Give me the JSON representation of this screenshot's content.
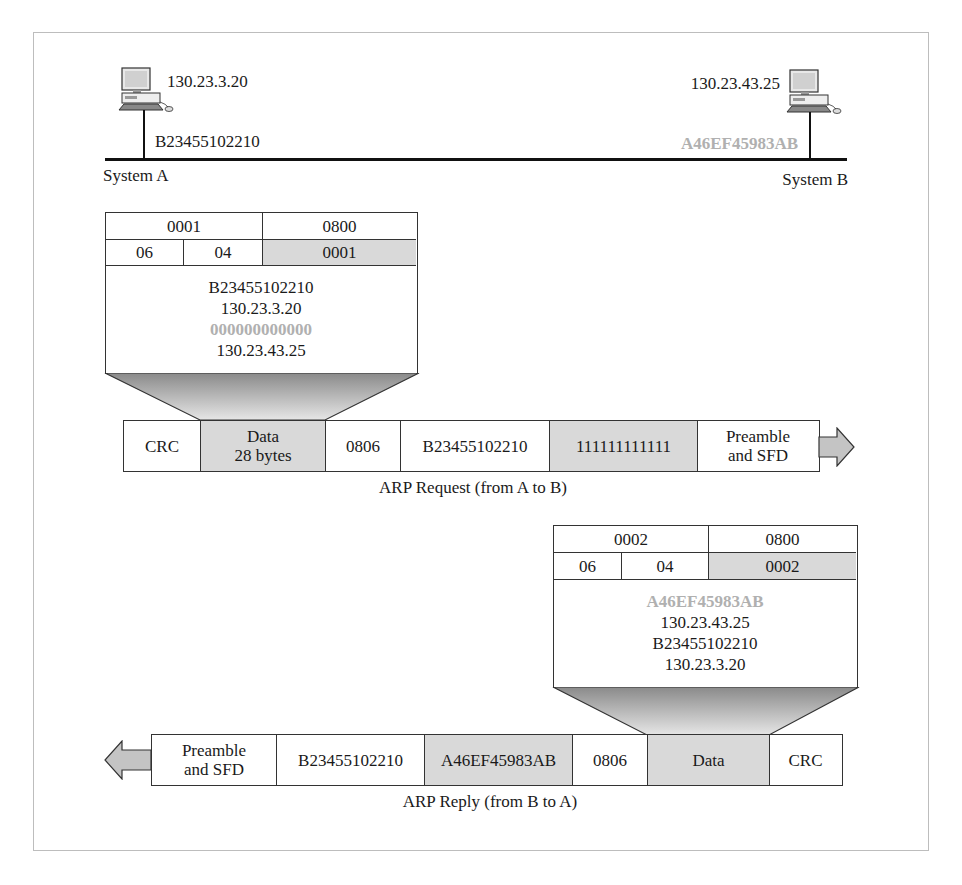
{
  "network": {
    "system_a": {
      "label": "System A",
      "ip": "130.23.3.20",
      "mac": "B23455102210"
    },
    "system_b": {
      "label": "System B",
      "ip": "130.23.43.25",
      "mac": "A46EF45983AB"
    }
  },
  "request": {
    "packet": {
      "hardware_type": "0001",
      "protocol_type": "0800",
      "hardware_length": "06",
      "protocol_length": "04",
      "operation": "0001",
      "sender_mac": "B23455102210",
      "sender_ip": "130.23.3.20",
      "target_mac": "000000000000",
      "target_ip": "130.23.43.25"
    },
    "frame": {
      "crc": "CRC",
      "data_line1": "Data",
      "data_line2": "28 bytes",
      "type": "0806",
      "source": "B23455102210",
      "destination": "111111111111",
      "preamble_line1": "Preamble",
      "preamble_line2": "and SFD"
    },
    "caption": "ARP Request (from A to B)"
  },
  "reply": {
    "packet": {
      "hardware_type": "0002",
      "protocol_type": "0800",
      "hardware_length": "06",
      "protocol_length": "04",
      "operation": "0002",
      "sender_mac": "A46EF45983AB",
      "sender_ip": "130.23.43.25",
      "target_mac": "B23455102210",
      "target_ip": "130.23.3.20"
    },
    "frame": {
      "preamble_line1": "Preamble",
      "preamble_line2": "and SFD",
      "destination": "B23455102210",
      "source": "A46EF45983AB",
      "type": "0806",
      "data": "Data",
      "crc": "CRC"
    },
    "caption": "ARP Reply (from B to A)"
  },
  "colors": {
    "highlight_text": "#b0b0b0",
    "shaded_cell": "#d9d9d9",
    "arrow_fill": "#c4c4c4",
    "line": "#111111"
  }
}
